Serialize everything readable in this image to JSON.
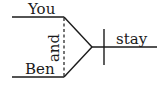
{
  "diagram": {
    "type": "sentence-diagram",
    "subject": {
      "compound": true,
      "items": [
        "You",
        "Ben"
      ],
      "conjunction": "and"
    },
    "predicate": {
      "verb": "stay"
    },
    "colors": {
      "ink": "#1a1a1a",
      "background": "#ffffff"
    }
  }
}
